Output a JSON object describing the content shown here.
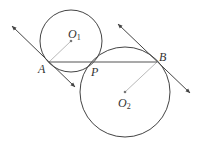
{
  "diagram": {
    "type": "geometry",
    "colors": {
      "stroke": "#444444",
      "radius": "#b0b0b0",
      "background": "#ffffff"
    },
    "circles": [
      {
        "name": "O1",
        "cx": 71,
        "cy": 41,
        "r": 31
      },
      {
        "name": "O2",
        "cx": 125,
        "cy": 92,
        "r": 45
      }
    ],
    "points": {
      "A": {
        "x": 49,
        "y": 62,
        "label": "A"
      },
      "P": {
        "x": 94,
        "y": 62,
        "label": "P"
      },
      "B": {
        "x": 157,
        "y": 62,
        "label": "B"
      },
      "O1": {
        "x": 71,
        "y": 41,
        "label": "O",
        "sub": "1"
      },
      "O2": {
        "x": 125,
        "y": 92,
        "label": "O",
        "sub": "2"
      }
    },
    "segments": [
      {
        "name": "AB",
        "from": "A",
        "to": "B"
      },
      {
        "name": "O1A",
        "from": "O1",
        "to": "A"
      },
      {
        "name": "O2B",
        "from": "O2",
        "to": "B"
      }
    ],
    "tangent_lines": [
      {
        "name": "tangent-at-A",
        "x1": 12,
        "y1": 26,
        "x2": 75,
        "y2": 87
      },
      {
        "name": "tangent-at-B",
        "x1": 118,
        "y1": 24,
        "x2": 190,
        "y2": 93
      }
    ]
  }
}
